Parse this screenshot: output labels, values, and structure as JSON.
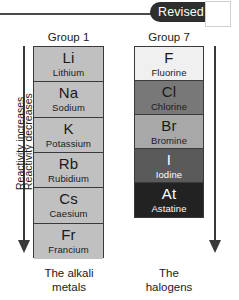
{
  "banner": {
    "badge_label": "Revised"
  },
  "columns": [
    {
      "heading": "Group 1",
      "caption": "The alkali\nmetals",
      "caption_line1": "The alkali",
      "caption_line2": "metals",
      "arrow_caption": "Reactivity increases",
      "arrow_direction": "down",
      "arrow_side": "left",
      "elements": [
        {
          "symbol": "Li",
          "name": "Lithium",
          "fill": "#c0c0c0",
          "text": "#1a1a1a"
        },
        {
          "symbol": "Na",
          "name": "Sodium",
          "fill": "#c0c0c0",
          "text": "#1a1a1a"
        },
        {
          "symbol": "K",
          "name": "Potassium",
          "fill": "#c0c0c0",
          "text": "#1a1a1a"
        },
        {
          "symbol": "Rb",
          "name": "Rubidium",
          "fill": "#c0c0c0",
          "text": "#1a1a1a"
        },
        {
          "symbol": "Cs",
          "name": "Caesium",
          "fill": "#c0c0c0",
          "text": "#1a1a1a"
        },
        {
          "symbol": "Fr",
          "name": "Francium",
          "fill": "#c0c0c0",
          "text": "#1a1a1a"
        }
      ]
    },
    {
      "heading": "Group 7",
      "caption": "The\nhalogens",
      "caption_line1": "The",
      "caption_line2": "halogens",
      "arrow_caption": "Reactivity decreases",
      "arrow_direction": "down",
      "arrow_side": "right",
      "elements": [
        {
          "symbol": "F",
          "name": "Fluorine",
          "fill": "#f0f0f0",
          "text": "#1a1a1a"
        },
        {
          "symbol": "Cl",
          "name": "Chlorine",
          "fill": "#787878",
          "text": "#1a1a1a"
        },
        {
          "symbol": "Br",
          "name": "Bromine",
          "fill": "#a8a8a8",
          "text": "#1a1a1a"
        },
        {
          "symbol": "I",
          "name": "Iodine",
          "fill": "#5a5a5a",
          "text": "#ffffff"
        },
        {
          "symbol": "At",
          "name": "Astatine",
          "fill": "#222222",
          "text": "#ffffff"
        }
      ]
    }
  ]
}
